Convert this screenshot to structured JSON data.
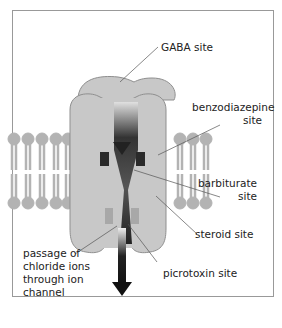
{
  "labels": {
    "gaba": "GABA site",
    "benzo_line1": "benzodiazepine",
    "benzo_line2": "site",
    "barb_line1": "barbiturate",
    "barb_line2": "site",
    "steroid": "steroid site",
    "picrotoxin": "picrotoxin site",
    "passage_line1": "passage of",
    "passage_line2": "chloride ions",
    "passage_line3": "through ion",
    "passage_line4": "channel"
  },
  "colors": {
    "protein": "#c8c8c8",
    "protein_edge": "#8f8f8f",
    "lipid": "#b3b3b3",
    "arrow": "#222222"
  }
}
